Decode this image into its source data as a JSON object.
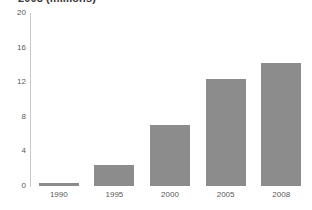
{
  "chart_data": {
    "type": "bar",
    "title": "2008 (millions)",
    "xlabel": "",
    "ylabel": "",
    "categories": [
      "1990",
      "1995",
      "2000",
      "2005",
      "2008"
    ],
    "values": [
      0.4,
      2.4,
      7.0,
      12.4,
      14.2
    ],
    "yticks": [
      0,
      4,
      8,
      12,
      16,
      20
    ],
    "ylim": [
      0,
      20
    ],
    "grid": false,
    "legend": null,
    "bar_color": "#8c8c8c",
    "axis_color": "#c8c8c8",
    "tick_label_color": "#595959",
    "title_color": "#3a3a3a",
    "background": "#ffffff"
  }
}
